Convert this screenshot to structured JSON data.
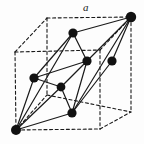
{
  "figure": {
    "type": "crystal-lattice-diagram",
    "background_color": "#fdfdfd",
    "line_color": "#1a1a1a",
    "atom_color": "#111111",
    "labels": [
      {
        "id": "edge-a",
        "text": "a",
        "x": 83,
        "y": 2,
        "italic": true
      }
    ],
    "cube": {
      "style": "dashed",
      "stroke_width": 1.1,
      "dash_pattern": "3,2.6",
      "vertices": {
        "front_top_left": {
          "x": 15,
          "y": 52
        },
        "front_top_right": {
          "x": 100,
          "y": 50
        },
        "front_bottom_left": {
          "x": 16,
          "y": 130
        },
        "front_bottom_right": {
          "x": 100,
          "y": 129
        },
        "back_top_left": {
          "x": 47,
          "y": 18
        },
        "back_top_right": {
          "x": 131,
          "y": 17
        },
        "back_bottom_left": {
          "x": 47,
          "y": 95
        },
        "back_bottom_right": {
          "x": 131,
          "y": 112
        }
      }
    },
    "primitive_cell": {
      "style": "solid",
      "stroke_width": 1.2,
      "origin_vertex": "front_bottom_left",
      "apex_vertex": "back_top_right"
    },
    "atoms": [
      {
        "id": "atom-origin",
        "x": 16,
        "y": 130,
        "r": 5.0,
        "label": "cube-corner-front-bottom-left"
      },
      {
        "id": "atom-apex",
        "x": 131,
        "y": 17,
        "r": 5.2,
        "label": "cube-corner-back-top-right"
      },
      {
        "id": "atom-face-top",
        "x": 73,
        "y": 33,
        "r": 4.6,
        "label": "face-centre-top"
      },
      {
        "id": "atom-face-left",
        "x": 34,
        "y": 78,
        "r": 4.6,
        "label": "face-centre-left"
      },
      {
        "id": "atom-face-mid",
        "x": 87,
        "y": 61,
        "r": 4.6,
        "label": "face-centre-back"
      },
      {
        "id": "atom-face-right",
        "x": 112,
        "y": 61,
        "r": 4.6,
        "label": "face-centre-right"
      },
      {
        "id": "atom-body-inner",
        "x": 61,
        "y": 87,
        "r": 4.4,
        "label": "interior-node"
      },
      {
        "id": "atom-face-bottom",
        "x": 72,
        "y": 113,
        "r": 4.6,
        "label": "face-centre-front"
      }
    ],
    "solid_edges": [
      {
        "from": "atom-origin",
        "to": "atom-face-top",
        "name": "edge-origin-to-face-top"
      },
      {
        "from": "atom-origin",
        "to": "atom-face-left",
        "name": "edge-origin-to-face-left"
      },
      {
        "from": "atom-origin",
        "to": "atom-body-inner",
        "name": "edge-origin-to-inner"
      },
      {
        "from": "atom-origin",
        "to": "atom-face-bottom",
        "name": "edge-origin-to-face-bottom"
      },
      {
        "from": "atom-apex",
        "to": "atom-face-top",
        "name": "edge-apex-to-face-top"
      },
      {
        "from": "atom-apex",
        "to": "atom-face-mid",
        "name": "edge-apex-to-face-mid"
      },
      {
        "from": "atom-apex",
        "to": "atom-face-right",
        "name": "edge-apex-to-face-right"
      },
      {
        "from": "atom-apex",
        "to": "atom-face-bottom",
        "name": "edge-apex-to-face-bottom"
      },
      {
        "from": "atom-face-top",
        "to": "atom-face-left",
        "name": "edge-face-top-to-face-left"
      },
      {
        "from": "atom-face-top",
        "to": "atom-face-mid",
        "name": "edge-face-top-to-face-mid"
      },
      {
        "from": "atom-face-left",
        "to": "atom-body-inner",
        "name": "edge-face-left-to-inner"
      },
      {
        "from": "atom-face-mid",
        "to": "atom-body-inner",
        "name": "edge-face-mid-to-inner"
      },
      {
        "from": "atom-face-mid",
        "to": "atom-face-bottom",
        "name": "edge-face-mid-to-face-bottom"
      },
      {
        "from": "atom-face-right",
        "to": "atom-face-bottom",
        "name": "edge-face-right-to-face-bottom"
      },
      {
        "from": "atom-body-inner",
        "to": "atom-face-bottom",
        "name": "edge-inner-to-face-bottom"
      },
      {
        "from": "atom-face-left",
        "to": "atom-face-mid",
        "name": "edge-face-left-to-face-mid"
      }
    ],
    "dashed_edges": [
      {
        "from": "front_top_left",
        "to": "front_top_right",
        "name": "cube-edge-front-top"
      },
      {
        "from": "front_top_left",
        "to": "front_bottom_left",
        "name": "cube-edge-front-left"
      },
      {
        "from": "front_top_right",
        "to": "front_bottom_right",
        "name": "cube-edge-front-right"
      },
      {
        "from": "front_bottom_left",
        "to": "front_bottom_right",
        "name": "cube-edge-front-bottom"
      },
      {
        "from": "back_top_left",
        "to": "back_top_right",
        "name": "cube-edge-back-top"
      },
      {
        "from": "back_top_left",
        "to": "back_bottom_left",
        "name": "cube-edge-back-left"
      },
      {
        "from": "back_top_right",
        "to": "back_bottom_right",
        "name": "cube-edge-back-right"
      },
      {
        "from": "back_bottom_left",
        "to": "back_bottom_right",
        "name": "cube-edge-back-bottom"
      },
      {
        "from": "front_top_left",
        "to": "back_top_left",
        "name": "cube-edge-top-left-depth"
      },
      {
        "from": "front_top_right",
        "to": "back_top_right",
        "name": "cube-edge-top-right-depth"
      },
      {
        "from": "front_bottom_left",
        "to": "back_bottom_left",
        "name": "cube-edge-bottom-left-depth"
      },
      {
        "from": "front_bottom_right",
        "to": "back_bottom_right",
        "name": "cube-edge-bottom-right-depth"
      }
    ]
  }
}
